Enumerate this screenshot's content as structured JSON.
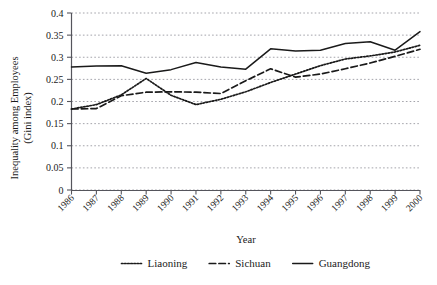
{
  "chart_data": {
    "type": "line",
    "title": "",
    "xlabel": "Year",
    "ylabel": "Inequality among Employees\n(Gini index)",
    "ylabel_line1": "Inequality among Employees",
    "ylabel_line2": "(Gini index)",
    "x": [
      1986,
      1987,
      1988,
      1989,
      1990,
      1991,
      1992,
      1993,
      1994,
      1995,
      1996,
      1997,
      1998,
      1999,
      2000
    ],
    "categories": [
      "1986",
      "1987",
      "1988",
      "1989",
      "1990",
      "1991",
      "1992",
      "1993",
      "1994",
      "1995",
      "1996",
      "1997",
      "1998",
      "1999",
      "2000"
    ],
    "xlim": [
      1986,
      2000
    ],
    "ylim": [
      0,
      0.4
    ],
    "yticks": [
      0,
      0.05,
      0.1,
      0.15,
      0.2,
      0.25,
      0.3,
      0.35,
      0.4
    ],
    "ytick_labels": [
      "0",
      "0.05",
      "0.1",
      "0.15",
      "0.2",
      "0.25",
      "0.3",
      "0.35",
      "0.4"
    ],
    "grid": true,
    "grid_axis": "y",
    "grid_style": "dotted",
    "legend_position": "bottom",
    "series": [
      {
        "name": "Liaoning",
        "style": "dotted",
        "color": "#1a1a1a",
        "values": [
          0.183,
          0.193,
          0.215,
          0.252,
          0.214,
          0.193,
          0.205,
          0.222,
          0.243,
          0.262,
          0.281,
          0.296,
          0.303,
          0.312,
          0.327
        ]
      },
      {
        "name": "Sichuan",
        "style": "dashed",
        "color": "#1a1a1a",
        "values": [
          0.183,
          0.184,
          0.213,
          0.221,
          0.222,
          0.221,
          0.218,
          0.247,
          0.274,
          0.255,
          0.262,
          0.274,
          0.287,
          0.302,
          0.318
        ]
      },
      {
        "name": "Guangdong",
        "style": "solid",
        "color": "#1a1a1a",
        "values": [
          0.278,
          0.28,
          0.281,
          0.264,
          0.272,
          0.288,
          0.278,
          0.273,
          0.319,
          0.314,
          0.316,
          0.331,
          0.335,
          0.316,
          0.358
        ]
      }
    ]
  },
  "legend": {
    "items": [
      {
        "label": "Liaoning",
        "style": "dotted"
      },
      {
        "label": "Sichuan",
        "style": "dashed"
      },
      {
        "label": "Guangdong",
        "style": "solid"
      }
    ]
  }
}
